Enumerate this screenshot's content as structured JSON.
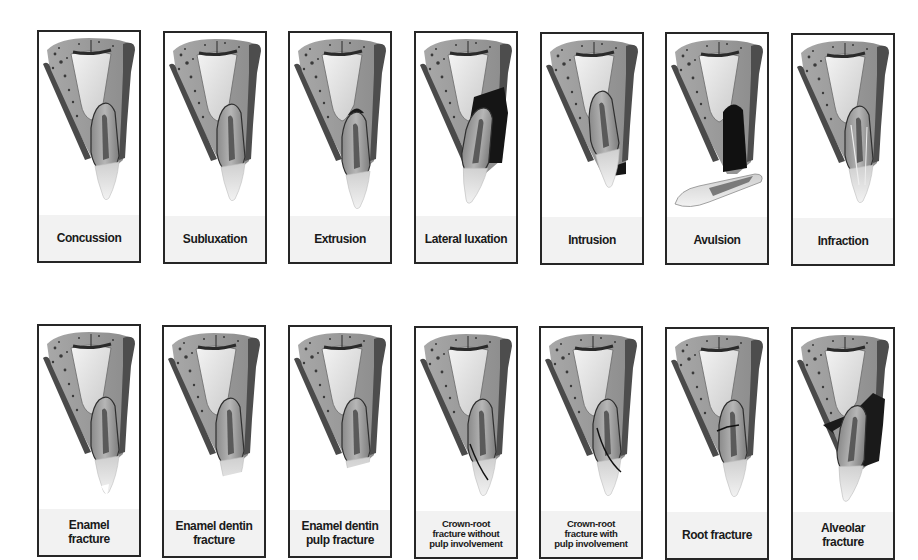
{
  "figure": {
    "rows": [
      {
        "name": "luxation-injuries",
        "panels": [
          {
            "id": "concussion",
            "label": "Concussion",
            "variant": "normal"
          },
          {
            "id": "subluxation",
            "label": "Subluxation",
            "variant": "normal"
          },
          {
            "id": "extrusion",
            "label": "Extrusion",
            "variant": "extrusion"
          },
          {
            "id": "lateral-luxation",
            "label": "Lateral luxation",
            "variant": "lateral"
          },
          {
            "id": "intrusion",
            "label": "Intrusion",
            "variant": "intrusion"
          },
          {
            "id": "avulsion",
            "label": "Avulsion",
            "variant": "avulsion"
          },
          {
            "id": "infraction",
            "label": "Infraction",
            "variant": "infraction"
          }
        ]
      },
      {
        "name": "fracture-injuries",
        "panels": [
          {
            "id": "enamel-fracture",
            "label_line1": "Enamel",
            "label_line2": "fracture",
            "variant": "enamel"
          },
          {
            "id": "enamel-dentin-fracture",
            "label_line1": "Enamel dentin",
            "label_line2": "fracture",
            "variant": "enamel-dentin"
          },
          {
            "id": "enamel-dentin-pulp-fracture",
            "label_line1": "Enamel dentin",
            "label_line2": "pulp fracture",
            "variant": "enamel-dentin-pulp"
          },
          {
            "id": "crown-root-without-pulp",
            "label_line1": "Crown-root",
            "label_line2": "fracture without",
            "label_line3": "pulp involvement",
            "variant": "crown-root-a"
          },
          {
            "id": "crown-root-with-pulp",
            "label_line1": "Crown-root",
            "label_line2": "fracture with",
            "label_line3": "pulp involvement",
            "variant": "crown-root-b"
          },
          {
            "id": "root-fracture",
            "label": "Root fracture",
            "variant": "root"
          },
          {
            "id": "alveolar-fracture",
            "label_line1": "Alveolar",
            "label_line2": "fracture",
            "variant": "alveolar"
          }
        ]
      }
    ]
  },
  "colors": {
    "border": "#262626",
    "label_band": "#f2f2f2",
    "bone": "#9a9a9a",
    "cortex": "#4a4a4a",
    "crown": "#dcdcdc",
    "pulp": "#555555",
    "injury": "#111111"
  }
}
